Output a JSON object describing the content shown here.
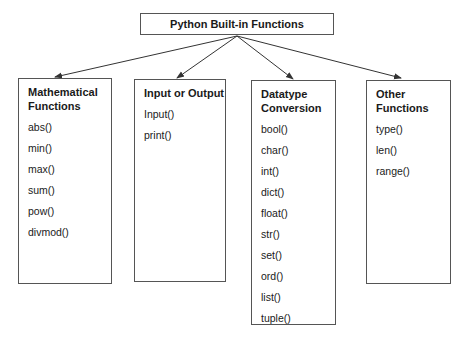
{
  "title": "Python Built-in Functions",
  "categories": [
    {
      "heading_lines": [
        "Mathematical",
        "Functions"
      ],
      "items": [
        "abs()",
        "min()",
        "max()",
        "sum()",
        "pow()",
        "divmod()"
      ]
    },
    {
      "heading_lines": [
        "Input or Output"
      ],
      "items": [
        "Input()",
        "print()"
      ]
    },
    {
      "heading_lines": [
        "Datatype",
        "Conversion"
      ],
      "items": [
        "bool()",
        "char()",
        "int()",
        "dict()",
        "float()",
        "str()",
        "set()",
        "ord()",
        "list()",
        "tuple()"
      ]
    },
    {
      "heading_lines": [
        "Other Functions"
      ],
      "items": [
        "type()",
        "len()",
        "range()"
      ]
    }
  ],
  "colors": {
    "border": "#555555",
    "arrow": "#333333",
    "text": "#1a1a1a",
    "background": "#ffffff"
  }
}
